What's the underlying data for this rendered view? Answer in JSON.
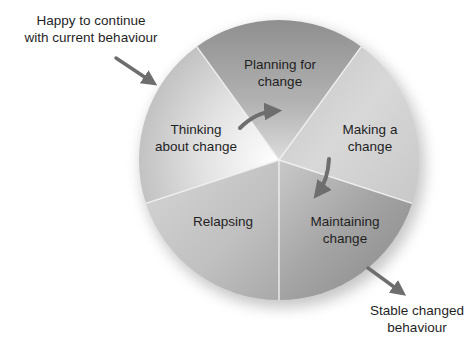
{
  "diagram": {
    "type": "cycle-of-change",
    "center": [
      279,
      160
    ],
    "radius": 140,
    "segments": [
      {
        "id": "thinking",
        "lines": [
          "Thinking",
          "about change"
        ],
        "fill": "#d9d9d9",
        "fill_dark": "#bdbdbd"
      },
      {
        "id": "planning",
        "lines": [
          "Planning for",
          "change"
        ],
        "fill": "#a3a3a3",
        "fill_dark": "#8a8a8a"
      },
      {
        "id": "making",
        "lines": [
          "Making a",
          "change"
        ],
        "fill": "#d0d0d0",
        "fill_dark": "#b8b8b8"
      },
      {
        "id": "maintaining",
        "lines": [
          "Maintaining",
          "change"
        ],
        "fill": "#a8a8a8",
        "fill_dark": "#8c8c8c"
      },
      {
        "id": "relapsing",
        "lines": [
          "Relapsing"
        ],
        "fill": "#c6c6c6",
        "fill_dark": "#adadad"
      }
    ],
    "external_labels": {
      "entry": [
        "Happy to continue",
        "with current behaviour"
      ],
      "exit": [
        "Stable changed",
        "behaviour"
      ]
    },
    "arrow_color": "#6e6e6e",
    "divider_color": "#f2f2f2"
  }
}
